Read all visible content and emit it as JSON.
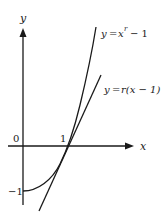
{
  "diagram": {
    "type": "function-plot",
    "axes": {
      "x_label": "x",
      "y_label": "y",
      "origin_label": "0",
      "x_tick_label": "1",
      "y_tick_label": "−1"
    },
    "curves": [
      {
        "name": "power-curve",
        "label_y": "y",
        "label_eq": "=",
        "label_base": "x",
        "label_exp": "r",
        "label_rest": "− 1",
        "equation": "y = x^r − 1"
      },
      {
        "name": "tangent-line",
        "label_y": "y",
        "label_eq": "=",
        "label_rest": "r(x − 1)",
        "equation": "y = r(x − 1)"
      }
    ],
    "colors": {
      "ink": "#1a1a1a",
      "background": "#ffffff"
    }
  }
}
